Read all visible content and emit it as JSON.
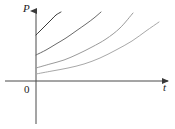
{
  "figure": {
    "title": "",
    "background_color": "#ffffff",
    "width": 175,
    "height": 129
  },
  "labels": {
    "y_axis": "P",
    "x_axis": "t",
    "origin": "0"
  },
  "chart_data": {
    "type": "line",
    "title": "",
    "xlabel": "t",
    "ylabel": "P",
    "grid": false,
    "legend": null,
    "axis_style": "arrow-headed cartesian axes, first quadrant only",
    "xlim": [
      0,
      1
    ],
    "ylim": [
      0,
      1
    ],
    "series": [
      {
        "name": "curve-1",
        "color": "#3a3a3a",
        "y_intercept_px": 35,
        "start_px": [
          36,
          35
        ],
        "end_px": [
          61,
          12
        ],
        "points_px": [
          [
            36,
            35
          ],
          [
            40,
            31
          ],
          [
            44,
            27
          ],
          [
            48,
            23
          ],
          [
            52,
            19
          ],
          [
            56,
            15
          ],
          [
            61,
            12
          ]
        ]
      },
      {
        "name": "curve-2",
        "color": "#6a6a6a",
        "y_intercept_px": 55,
        "start_px": [
          36,
          55
        ],
        "end_px": [
          101,
          12
        ],
        "points_px": [
          [
            36,
            55
          ],
          [
            46,
            50
          ],
          [
            56,
            44
          ],
          [
            66,
            38
          ],
          [
            76,
            31
          ],
          [
            86,
            24
          ],
          [
            94,
            18
          ],
          [
            101,
            12
          ]
        ]
      },
      {
        "name": "curve-3",
        "color": "#9a9a9a",
        "y_intercept_px": 68,
        "start_px": [
          36,
          68
        ],
        "end_px": [
          133,
          13
        ],
        "points_px": [
          [
            36,
            68
          ],
          [
            50,
            64
          ],
          [
            64,
            60
          ],
          [
            78,
            54
          ],
          [
            92,
            47
          ],
          [
            106,
            39
          ],
          [
            120,
            28
          ],
          [
            133,
            13
          ]
        ]
      },
      {
        "name": "curve-4",
        "color": "#a8a8a8",
        "y_intercept_px": 74,
        "start_px": [
          36,
          74
        ],
        "end_px": [
          159,
          22
        ],
        "points_px": [
          [
            36,
            74
          ],
          [
            52,
            71
          ],
          [
            68,
            68
          ],
          [
            84,
            64
          ],
          [
            100,
            58
          ],
          [
            116,
            50
          ],
          [
            132,
            41
          ],
          [
            146,
            31
          ],
          [
            159,
            22
          ]
        ]
      }
    ],
    "axes_px": {
      "origin": [
        36,
        81
      ],
      "x_axis_from": [
        5,
        81
      ],
      "x_axis_to": [
        170,
        81
      ],
      "y_axis_from": [
        36,
        124
      ],
      "y_axis_to": [
        36,
        9
      ]
    }
  },
  "colors": {
    "axis": "#4a4a4a",
    "text": "#1a1a1a",
    "background": "#ffffff"
  }
}
